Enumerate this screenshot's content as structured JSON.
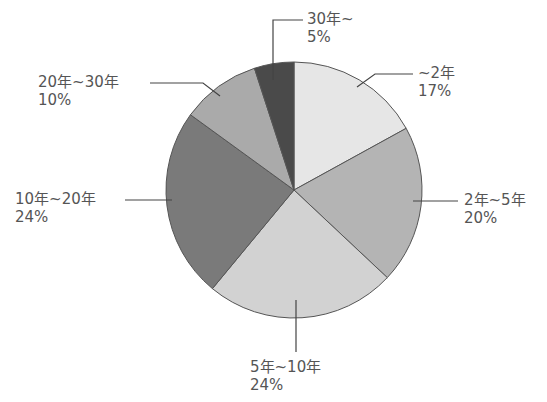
{
  "chart_data": {
    "type": "pie",
    "title": "",
    "categories": [
      "~2年",
      "2年~5年",
      "5年~10年",
      "10年~20年",
      "20年~30年",
      "30年~"
    ],
    "values": [
      17,
      20,
      24,
      24,
      10,
      5
    ],
    "unit": "%",
    "start_angle_deg": 0,
    "direction": "clockwise from 12 o'clock",
    "colors": [
      "#e6e6e6",
      "#b4b4b4",
      "#d2d2d2",
      "#7a7a7a",
      "#aaaaaa",
      "#4a4a4a"
    ],
    "legend": "none (leader-line labels)"
  },
  "labels": [
    {
      "name": "~2年",
      "pct": "17%"
    },
    {
      "name": "2年~5年",
      "pct": "20%"
    },
    {
      "name": "5年~10年",
      "pct": "24%"
    },
    {
      "name": "10年~20年",
      "pct": "24%"
    },
    {
      "name": "20年~30年",
      "pct": "10%"
    },
    {
      "name": "30年~",
      "pct": "5%"
    }
  ],
  "style": {
    "edge_color": "#555555",
    "leader_color": "#444444"
  }
}
